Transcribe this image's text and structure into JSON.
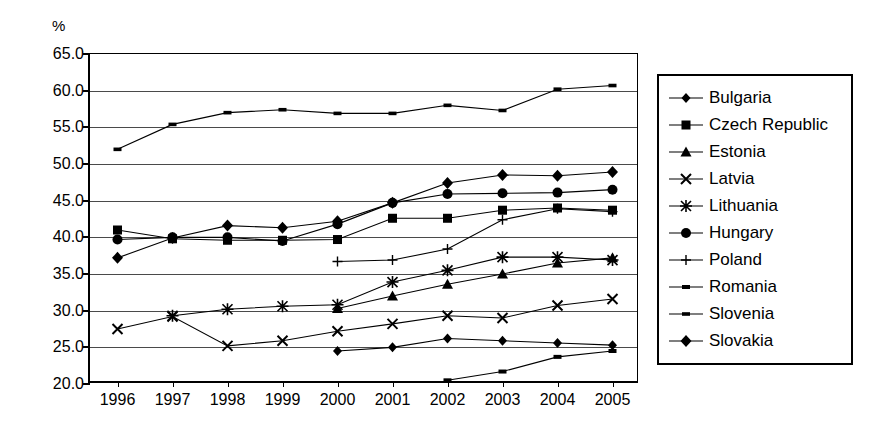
{
  "axis": {
    "unit_label": "%",
    "y_ticks": [
      "65.0",
      "60.0",
      "55.0",
      "50.0",
      "45.0",
      "40.0",
      "35.0",
      "30.0",
      "25.0",
      "20.0"
    ],
    "x_ticks": [
      "1996",
      "1997",
      "1998",
      "1999",
      "2000",
      "2001",
      "2002",
      "2003",
      "2004",
      "2005"
    ]
  },
  "legend": {
    "items": [
      {
        "label": "Bulgaria",
        "marker": "diamond-small-icon"
      },
      {
        "label": "Czech Republic",
        "marker": "square-icon"
      },
      {
        "label": "Estonia",
        "marker": "triangle-icon"
      },
      {
        "label": "Latvia",
        "marker": "x-cross-icon"
      },
      {
        "label": "Lithuania",
        "marker": "asterisk-icon"
      },
      {
        "label": "Hungary",
        "marker": "circle-icon"
      },
      {
        "label": "Poland",
        "marker": "plus-bar-icon"
      },
      {
        "label": "Romania",
        "marker": "dash-icon"
      },
      {
        "label": "Slovenia",
        "marker": "line-icon"
      },
      {
        "label": "Slovakia",
        "marker": "diamond-icon"
      }
    ]
  },
  "chart_data": {
    "type": "line",
    "title": "",
    "xlabel": "",
    "ylabel": "%",
    "ylim": [
      20.0,
      65.0
    ],
    "ytick_step": 5.0,
    "grid": true,
    "legend_position": "right",
    "x": [
      "1996",
      "1997",
      "1998",
      "1999",
      "2000",
      "2001",
      "2002",
      "2003",
      "2004",
      "2005"
    ],
    "series": [
      {
        "name": "Bulgaria",
        "marker": "diamond-small",
        "values": [
          null,
          null,
          null,
          null,
          24.5,
          25.0,
          26.2,
          25.9,
          25.6,
          25.3
        ]
      },
      {
        "name": "Czech Republic",
        "marker": "square",
        "values": [
          41.0,
          39.8,
          39.6,
          39.6,
          39.7,
          42.6,
          42.6,
          43.7,
          44.0,
          43.7
        ]
      },
      {
        "name": "Estonia",
        "marker": "triangle",
        "values": [
          null,
          null,
          null,
          null,
          30.3,
          32.0,
          33.6,
          35.0,
          36.5,
          37.2
        ]
      },
      {
        "name": "Latvia",
        "marker": "x-cross",
        "values": [
          27.5,
          29.2,
          25.2,
          25.9,
          27.2,
          28.2,
          29.3,
          29.0,
          30.7,
          31.6
        ]
      },
      {
        "name": "Lithuania",
        "marker": "asterisk",
        "values": [
          null,
          29.3,
          30.2,
          30.6,
          30.8,
          33.9,
          35.5,
          37.3,
          37.3,
          36.9
        ]
      },
      {
        "name": "Hungary",
        "marker": "circle",
        "values": [
          39.7,
          40.0,
          40.0,
          39.5,
          41.8,
          44.7,
          45.9,
          46.0,
          46.1,
          46.5
        ]
      },
      {
        "name": "Poland",
        "marker": "plus-bar",
        "values": [
          null,
          null,
          null,
          null,
          36.7,
          36.9,
          38.4,
          42.4,
          43.9,
          43.5
        ]
      },
      {
        "name": "Romania",
        "marker": "dash",
        "values": [
          null,
          null,
          null,
          null,
          null,
          null,
          20.5,
          21.7,
          23.7,
          24.5
        ]
      },
      {
        "name": "Slovenia",
        "marker": "line",
        "values": [
          52.0,
          55.4,
          57.0,
          57.4,
          56.9,
          56.9,
          58.0,
          57.3,
          60.2,
          60.7
        ]
      },
      {
        "name": "Slovakia",
        "marker": "diamond",
        "values": [
          37.2,
          39.9,
          41.6,
          41.3,
          42.2,
          44.7,
          47.4,
          48.5,
          48.4,
          48.9
        ]
      }
    ]
  }
}
